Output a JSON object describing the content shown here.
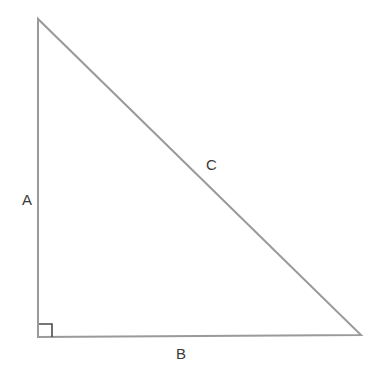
{
  "diagram": {
    "type": "right-triangle",
    "labels": {
      "side_a": "A",
      "side_b": "B",
      "side_c": "C"
    },
    "colors": {
      "stroke": "#9a9a9a",
      "right_angle_marker": "#4a4a4a",
      "label": "#3a3a3a"
    }
  }
}
